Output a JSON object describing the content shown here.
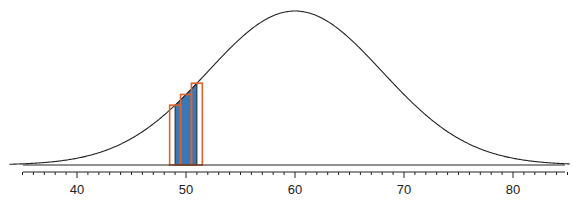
{
  "chart_data": {
    "type": "area",
    "title": "",
    "xlabel": "",
    "ylabel": "",
    "distribution": {
      "name": "normal",
      "mean": 60,
      "sd": 8
    },
    "xlim": [
      35,
      85
    ],
    "x_ticks": [
      40,
      50,
      60,
      70,
      80
    ],
    "x_tick_labels": [
      "40",
      "50",
      "60",
      "70",
      "80"
    ],
    "minor_tick_step": 1,
    "shaded_region": {
      "from": 49,
      "to": 51,
      "color": "#3a78b5"
    },
    "rectangles": [
      {
        "from": 48.5,
        "to": 49.5,
        "color": "#e0622a"
      },
      {
        "from": 49.5,
        "to": 50.5,
        "color": "#e0622a"
      },
      {
        "from": 50.5,
        "to": 51.5,
        "color": "#e0622a"
      }
    ],
    "grid": false,
    "legend": null
  },
  "colors": {
    "curve": "#222222",
    "shade": "#3a78b5",
    "rect_outline": "#e0622a",
    "axis": "#222222"
  }
}
